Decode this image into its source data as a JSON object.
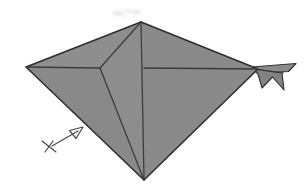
{
  "document": {
    "kind": "origami-instruction-diagram",
    "title": "Origami fold step: kite base with reverse-folded tail",
    "background_color": "#ffffff",
    "width": 306,
    "height": 190
  },
  "palette": {
    "paper_fill": "#8b8b8b",
    "paper_fill_light": "#949494",
    "paper_fill_shadow": "#7e7e7e",
    "crease_line": "#3b3b3b",
    "outline": "#2e2e2e",
    "symbol_line": "#4a4a4a",
    "smudge": "#d8d8d8",
    "white": "#ffffff"
  },
  "figure": {
    "name": "folded-paper-model",
    "panels": [
      {
        "name": "upper-left-panel",
        "label": "Upper left flap",
        "fill": "#8e8e8e",
        "points": "26,67 141,22 100,68"
      },
      {
        "name": "lower-left-panel",
        "label": "Lower left flap",
        "fill": "#898989",
        "points": "26,67 100,68 144,180"
      },
      {
        "name": "center-wedge-panel",
        "label": "Center wedge flap",
        "fill": "#8d8d8d",
        "points": "100,68 141,22 144,180"
      },
      {
        "name": "upper-right-panel",
        "label": "Upper right flap",
        "fill": "#8a8a8a",
        "points": "141,22 258,69 144,180"
      }
    ],
    "creases": [
      {
        "name": "crease-apex-to-junction",
        "from": "141,22",
        "to": "100,68"
      },
      {
        "name": "crease-junction-to-bottom",
        "from": "100,68",
        "to": "144,180"
      },
      {
        "name": "crease-left-vertex-to-junction",
        "from": "26,67",
        "to": "100,68"
      },
      {
        "name": "crease-apex-to-bottom-spine",
        "from": "141,22",
        "to": "144,180"
      },
      {
        "name": "crease-horizontal-to-tail",
        "from": "144,68",
        "to": "258,69"
      }
    ],
    "tail": {
      "name": "tail-flap",
      "label": "Reverse-folded tail point",
      "fill": "#8a8a8a",
      "upper_blade_points": "255,67 295,64 288,71 262,72",
      "lower_barb_points": "255,70 281,73 283,89 272,77 262,87"
    }
  },
  "symbols": {
    "fold_arrow": {
      "name": "fold-direction-arrow",
      "label": "Fold / push direction arrow",
      "meaning": "arrow-pointing-up-right",
      "shaft_from": "52,146",
      "shaft_to": "78,131",
      "head_points": "82,128 70,132 76,139",
      "color": "#4a4a4a"
    },
    "cross_mark": {
      "name": "cross-mark-icon",
      "label": "Cross reference mark at arrow tail",
      "meaning": "x-cross-marker",
      "stroke_a_from": "42,141",
      "stroke_a_to": "56,152",
      "stroke_b_from": "45,152",
      "stroke_b_to": "53,141",
      "color": "#4a4a4a"
    },
    "smudges": [
      {
        "name": "scan-smudge-left",
        "cx": 118,
        "cy": 13,
        "rx": 6,
        "ry": 2.2,
        "opacity": 0.5
      },
      {
        "name": "scan-smudge-mid",
        "cx": 128,
        "cy": 11,
        "rx": 3,
        "ry": 2.0,
        "opacity": 0.42
      },
      {
        "name": "scan-smudge-right",
        "cx": 136,
        "cy": 12,
        "rx": 5,
        "ry": 2.2,
        "opacity": 0.45
      },
      {
        "name": "scan-smudge-low",
        "cx": 124,
        "cy": 17,
        "rx": 4,
        "ry": 1.6,
        "opacity": 0.3
      }
    ]
  },
  "accessibility": {
    "alt_text": "Black and white origami diagram showing a large gray kite-shaped folded paper with internal crease lines and a small pointed tail folded out to the right, plus an arrow with a cross marker at the lower left indicating the next fold.",
    "figure_caption": ""
  }
}
